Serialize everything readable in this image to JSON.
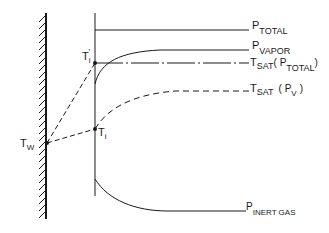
{
  "diagram": {
    "type": "condensation-interface-profile",
    "colors": {
      "ink": "#1a1a1a",
      "background": "#ffffff"
    },
    "labels": {
      "p_total": {
        "main": "P",
        "sub": "TOTAL"
      },
      "p_vapor": {
        "main": "P",
        "sub": "VAPOR"
      },
      "tsat_ptotal": {
        "main": "T",
        "sub": "SAT",
        "paren_open": "( P",
        "paren_sub": "TOTAL",
        "paren_close": ")"
      },
      "tsat_pv": {
        "main": "T",
        "sub": "SAT",
        "paren_open": "( P",
        "paren_sub": "V",
        "paren_close": ")"
      },
      "p_inert": {
        "main": "P",
        "sub": "INERT GAS"
      },
      "t_w": {
        "main": "T",
        "sub": "W"
      },
      "t_i": {
        "main": "T",
        "sub": "i"
      },
      "t_i_prime": {
        "main": "T",
        "sub": "i",
        "prime": "'"
      }
    },
    "elements": {
      "wall": "hatched solid wall",
      "interface_line": "vertical interface line",
      "p_total_line": "solid horizontal line",
      "p_vapor_curve": "solid rising curve",
      "tsat_ptotal_line": "dash-dot horizontal line",
      "tsat_pv_curve": "dashed rising curve",
      "p_inert_curve": "solid falling curve",
      "tw_to_ti_prime": "dashed line",
      "tw_to_ti": "dashed line"
    }
  }
}
